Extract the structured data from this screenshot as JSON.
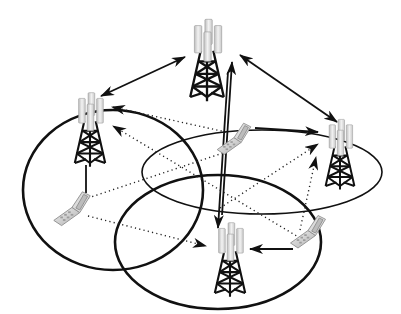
{
  "diagram": {
    "title": "Cellular network with base stations and mobile phones",
    "colors": {
      "background": "#ffffff",
      "line": "#111111",
      "antenna_light": "#eeeeee",
      "antenna_mid": "#cfcfcf",
      "antenna_dark": "#a8a8a8",
      "phone_light": "#e6e6e6",
      "phone_dark": "#b5b5b5"
    },
    "towers": [
      {
        "id": "tower-top",
        "x": 207,
        "y": 55,
        "label": "Base station (top)"
      },
      {
        "id": "tower-left",
        "x": 90,
        "y": 125,
        "label": "Base station (left)"
      },
      {
        "id": "tower-right",
        "x": 340,
        "y": 150,
        "label": "Base station (right)"
      },
      {
        "id": "tower-bottom",
        "x": 230,
        "y": 255,
        "label": "Base station (bottom)"
      }
    ],
    "phones": [
      {
        "id": "phone-center",
        "x": 232,
        "y": 138,
        "label": "Mobile phone (center)"
      },
      {
        "id": "phone-left",
        "x": 72,
        "y": 210,
        "label": "Mobile phone (left)"
      },
      {
        "id": "phone-right",
        "x": 308,
        "y": 232,
        "label": "Mobile phone (right)"
      }
    ],
    "coverage_cells": [
      {
        "id": "cell-left",
        "cx": 113,
        "cy": 190,
        "rx": 90,
        "ry": 80
      },
      {
        "id": "cell-right",
        "cx": 262,
        "cy": 172,
        "rx": 120,
        "ry": 42
      },
      {
        "id": "cell-bottom",
        "cx": 218,
        "cy": 240,
        "rx": 103,
        "ry": 67
      }
    ],
    "links": {
      "solid_bidirectional": [
        "tower-top ↔ tower-left",
        "tower-top ↔ tower-right"
      ],
      "solid": [
        "phone-center → tower-right",
        "phone-right → tower-bottom",
        "tower-bottom → tower-top",
        "tower-top → tower-bottom",
        "tower-left — phone-left"
      ],
      "dotted": [
        "phone-center → tower-left",
        "phone-right → tower-left",
        "phone-left → phone-center",
        "phone-left → tower-bottom",
        "phone-center → tower-bottom",
        "phone-left → tower-right",
        "phone-right → tower-right"
      ]
    }
  }
}
